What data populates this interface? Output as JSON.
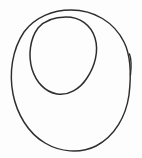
{
  "image": {
    "kind": "hand-drawn-line-sketch",
    "title": "Nested ellipses sketch",
    "description": "Two concentric hand-drawn closed curves forming an annulus / letter-Q-like form, with a small tick on the right edge of the outer curve",
    "width": 142,
    "height": 158,
    "background_color": "#fdfdfd",
    "stroke_color": "#2e2e2e"
  },
  "shapes": [
    {
      "name": "outer-contour",
      "type": "closed-freehand-ellipse",
      "label": "Outer ellipse",
      "bounds": {
        "x": 11,
        "y": 10,
        "width": 120,
        "height": 141
      },
      "center": {
        "x": 71,
        "y": 80
      },
      "radius_x": 60,
      "radius_y": 70,
      "stroke_width": 1.45,
      "path": "M 71 10 C 94 10 114 22 124 42 C 132 58 131 78 129 95 C 126 116 115 136 96 146 C 80 154 60 152 45 143 C 28 133 17 114 13 94 C 9 73 12 50 24 32 C 35 17 53 10 71 10 Z"
    },
    {
      "name": "inner-contour",
      "type": "closed-freehand-ellipse",
      "label": "Inner ellipse",
      "bounds": {
        "x": 31,
        "y": 17,
        "width": 66,
        "height": 78
      },
      "center": {
        "x": 64,
        "y": 56
      },
      "radius_x": 33,
      "radius_y": 39,
      "tilt_degrees": -12,
      "stroke_width": 1.5,
      "path": "M 66 17 C 80 17 91 25 95 38 C 99 51 95 66 87 78 C 80 89 68 96 57 94 C 45 92 36 82 32 69 C 28 55 30 39 38 28 C 45 20 56 17 66 17 Z"
    },
    {
      "name": "right-edge-tick",
      "type": "short-stroke",
      "label": "Small tick mark on right edge",
      "start": {
        "x": 130,
        "y": 54
      },
      "end": {
        "x": 130,
        "y": 75
      },
      "stroke_width": 1.35,
      "path": "M 129.5 54 C 131 58 131.5 66 130.5 75"
    }
  ]
}
